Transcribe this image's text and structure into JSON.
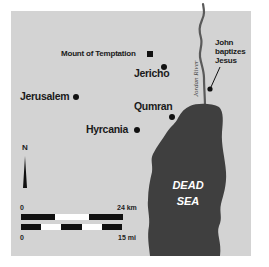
{
  "map": {
    "colors": {
      "background": "#ffffff",
      "land": "#d3d3d3",
      "water": "#3f3f3f",
      "river": "#5a5a5a",
      "text": "#1a1a1a"
    },
    "places": [
      {
        "name": "Mount of Temptation",
        "marker": "square"
      },
      {
        "name": "Jericho",
        "marker": "dot"
      },
      {
        "name": "Jerusalem",
        "marker": "dot"
      },
      {
        "name": "Qumran",
        "marker": "dot"
      },
      {
        "name": "Hyrcania",
        "marker": "dot"
      }
    ],
    "annotation": {
      "line1": "John",
      "line2": "baptizes",
      "line3": "Jesus"
    },
    "river_label": "Jordan River",
    "sea_label": {
      "line1": "DEAD",
      "line2": "SEA"
    },
    "north_label": "N",
    "scale": {
      "km": {
        "start": "0",
        "end": "24 km"
      },
      "mi": {
        "start": "0",
        "end": "15 mi"
      }
    }
  }
}
